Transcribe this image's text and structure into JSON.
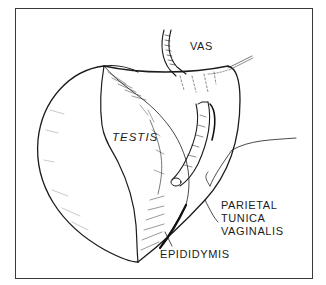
{
  "figure": {
    "type": "anatomical line illustration",
    "frame_color": "#3a3a3a",
    "ink_color": "#1c1c1c",
    "background": "#ffffff",
    "labels": {
      "vas": "VAS",
      "testis": "TESTIS",
      "parietal_tunica_vaginalis": {
        "line1": "PARIETAL",
        "line2": "TUNICA",
        "line3": "VAGINALIS"
      },
      "epididymis": "EPIDIDYMIS"
    },
    "structures": [
      "vas-deferens",
      "testis",
      "parietal-tunica-vaginalis",
      "epididymis",
      "suture-thread"
    ]
  }
}
